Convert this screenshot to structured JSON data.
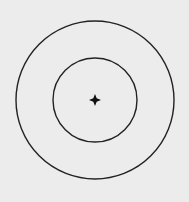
{
  "diagram": {
    "type": "concentric-circles",
    "background_color": "#ececec",
    "stroke_color": "#222222",
    "center": {
      "x": 95,
      "y": 100
    },
    "circles": [
      {
        "name": "outer-circle",
        "cx": 95,
        "cy": 100,
        "r": 79,
        "stroke_width": 1.4
      },
      {
        "name": "inner-circle",
        "cx": 95,
        "cy": 100,
        "r": 42,
        "stroke_width": 1.4
      }
    ],
    "center_marker": {
      "name": "center-point",
      "shape": "four-pointed-star",
      "cx": 95,
      "cy": 100,
      "size": 6,
      "color": "#111111"
    }
  }
}
